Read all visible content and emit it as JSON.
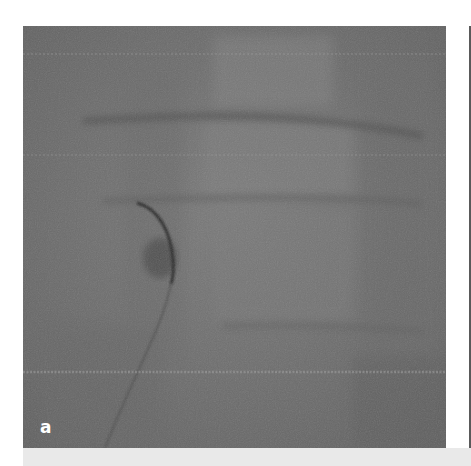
{
  "figure": {
    "panel_label": "a",
    "panel_type": "fluoroscopy x-ray",
    "colors": {
      "image_base": "#6f6f6f",
      "caption_band": "#e9e9e9",
      "label_text": "#ffffff",
      "background": "#ffffff"
    }
  }
}
